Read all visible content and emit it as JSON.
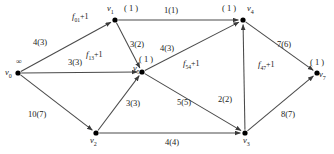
{
  "diagram": {
    "type": "network-flow-graph",
    "title": "",
    "nodes": [
      {
        "id": "v0",
        "label": "v",
        "sub": "0",
        "x": 18,
        "y": 73,
        "potential": "∞",
        "pot_x": 16,
        "pot_y": 58,
        "lab_x": 5,
        "lab_y": 68
      },
      {
        "id": "v1",
        "label": "v",
        "sub": "1",
        "x": 115,
        "y": 20,
        "potential": "( 1 )",
        "pot_x": 124,
        "pot_y": 4,
        "lab_x": 107,
        "lab_y": 4
      },
      {
        "id": "v2",
        "label": "v",
        "sub": "2",
        "x": 96,
        "y": 133,
        "potential": "",
        "pot_x": 0,
        "pot_y": 0,
        "lab_x": 90,
        "lab_y": 136
      },
      {
        "id": "v3",
        "label": "v",
        "sub": "3",
        "x": 245,
        "y": 133,
        "potential": "",
        "pot_x": 0,
        "pot_y": 0,
        "lab_x": 243,
        "lab_y": 136
      },
      {
        "id": "v4",
        "label": "v",
        "sub": "4",
        "x": 243,
        "y": 20,
        "potential": "( 1 )",
        "pot_x": 222,
        "pot_y": 4,
        "lab_x": 247,
        "lab_y": 4
      },
      {
        "id": "v5",
        "label": "v",
        "sub": "5",
        "x": 142,
        "y": 72,
        "potential": "( 1 )",
        "pot_x": 139,
        "pot_y": 55,
        "lab_x": 133,
        "lab_y": 64
      },
      {
        "id": "v7",
        "label": "v",
        "sub": "7",
        "x": 317,
        "y": 73,
        "potential": "( 1 )",
        "pot_x": 310,
        "pot_y": 58,
        "lab_x": 319,
        "lab_y": 70
      }
    ],
    "edges": [
      {
        "from": "v0",
        "to": "v1",
        "capacity": 4,
        "flow": 3,
        "label": "4(3)",
        "lab_x": 33,
        "lab_y": 38,
        "arrow": true
      },
      {
        "from": "v0",
        "to": "v5",
        "capacity": 3,
        "flow": 3,
        "label": "3(3)",
        "lab_x": 68,
        "lab_y": 58,
        "arrow": true
      },
      {
        "from": "v0",
        "to": "v2",
        "capacity": 10,
        "flow": 7,
        "label": "10(7)",
        "lab_x": 28,
        "lab_y": 110,
        "arrow": true
      },
      {
        "from": "v1",
        "to": "v4",
        "capacity": 1,
        "flow": 1,
        "label": "1(1)",
        "lab_x": 164,
        "lab_y": 6,
        "arrow": true
      },
      {
        "from": "v1",
        "to": "v5",
        "capacity": 3,
        "flow": 2,
        "label": "3(2)",
        "lab_x": 130,
        "lab_y": 40,
        "arrow": true
      },
      {
        "from": "v5",
        "to": "v4",
        "capacity": 4,
        "flow": 3,
        "label": "4(3)",
        "lab_x": 160,
        "lab_y": 44,
        "arrow": true
      },
      {
        "from": "v2",
        "to": "v5",
        "capacity": 3,
        "flow": 3,
        "label": "3(3)",
        "lab_x": 126,
        "lab_y": 99,
        "arrow": true
      },
      {
        "from": "v5",
        "to": "v3",
        "capacity": 5,
        "flow": 5,
        "label": "5(5)",
        "lab_x": 177,
        "lab_y": 98,
        "arrow": true
      },
      {
        "from": "v2",
        "to": "v3",
        "capacity": 4,
        "flow": 4,
        "label": "4(4)",
        "lab_x": 165,
        "lab_y": 138,
        "arrow": true
      },
      {
        "from": "v3",
        "to": "v4",
        "capacity": 2,
        "flow": 2,
        "label": "2(2)",
        "lab_x": 218,
        "lab_y": 95,
        "arrow": true
      },
      {
        "from": "v4",
        "to": "v7",
        "capacity": 7,
        "flow": 6,
        "label": "7(6)",
        "lab_x": 277,
        "lab_y": 40,
        "arrow": true
      },
      {
        "from": "v3",
        "to": "v7",
        "capacity": 8,
        "flow": 7,
        "label": "8(7)",
        "lab_x": 281,
        "lab_y": 110,
        "arrow": true
      }
    ],
    "residual_labels": [
      {
        "id": "f01",
        "base": "f",
        "sub": "01",
        "plus": "+1",
        "x": 72,
        "y": 12
      },
      {
        "id": "f13",
        "base": "f",
        "sub": "13",
        "plus": "+1",
        "x": 86,
        "y": 50
      },
      {
        "id": "f54",
        "base": "f",
        "sub": "54",
        "plus": "+1",
        "x": 183,
        "y": 59
      },
      {
        "id": "f47",
        "base": "f",
        "sub": "47",
        "plus": "+1",
        "x": 258,
        "y": 60
      }
    ],
    "colors": {
      "edge": "#4a4a4a",
      "node": "#000000",
      "text": "#1a1a1a",
      "background": "#ffffff"
    }
  }
}
